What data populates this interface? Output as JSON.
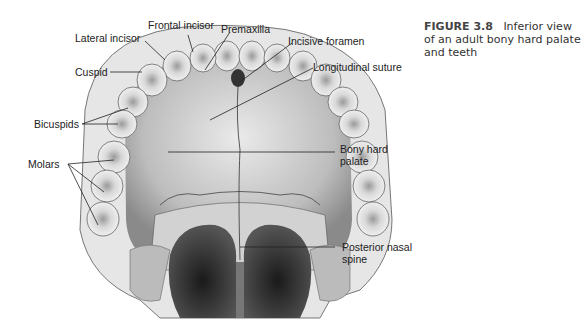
{
  "figure": {
    "number": "FIGURE 3.8",
    "caption": "Inferior view of an adult bony hard palate and teeth"
  },
  "labels": {
    "frontal_incisor": "Frontal incisor",
    "premaxilla": "Premaxilla",
    "lateral_incisor": "Lateral incisor",
    "incisive_foramen": "Incisive foramen",
    "cuspid": "Cuspid",
    "longitudinal_suture": "Longitudinal suture",
    "bicuspids": "Bicuspids",
    "molars": "Molars",
    "bony_hard_palate_1": "Bony hard",
    "bony_hard_palate_2": "palate",
    "posterior_nasal_spine_1": "Posterior nasal",
    "posterior_nasal_spine_2": "spine"
  },
  "colors": {
    "line": "#222222",
    "bone": "#d9d9d9",
    "tooth": "#eeeeee",
    "shadow": "#3a3a3a"
  }
}
